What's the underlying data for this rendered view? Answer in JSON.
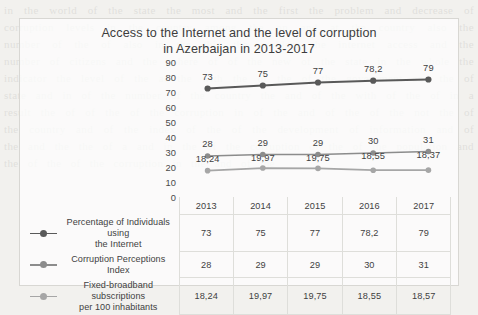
{
  "chart_data": {
    "type": "line",
    "title": "Access to the Internet and the level of corruption in Azerbaijan in 2013-2017",
    "title_line1": "Access to the Internet and the level of corruption",
    "title_line2": "in Azerbaijan in 2013-2017",
    "xlabel": "",
    "ylabel": "",
    "ylim": [
      0,
      90
    ],
    "yticks": [
      90,
      80,
      70,
      60,
      50,
      40,
      30,
      20,
      10,
      0
    ],
    "grid": false,
    "legend_position": "bottom-table",
    "categories": [
      "2013",
      "2014",
      "2015",
      "2016",
      "2017"
    ],
    "series": [
      {
        "name": "Percentage of Individuals using the Internet",
        "name_line1": "Percentage of Individuals using",
        "name_line2": "the Internet",
        "color": "#595959",
        "values": [
          73,
          75,
          77,
          78.2,
          79
        ],
        "labels": [
          "73",
          "75",
          "77",
          "78,2",
          "79"
        ]
      },
      {
        "name": "Corruption Perceptions Index",
        "name_line1": "Corruption Perceptions Index",
        "name_line2": "",
        "color": "#8c8c8c",
        "values": [
          28,
          29,
          29,
          30,
          31
        ],
        "labels": [
          "28",
          "29",
          "29",
          "30",
          "31"
        ]
      },
      {
        "name": "Fixed-broadband subscriptions per 100 inhabitants",
        "name_line1": "Fixed-broadband subscriptions",
        "name_line2": "per 100 inhabitants",
        "color": "#a6a6a6",
        "values": [
          18.24,
          19.97,
          19.75,
          18.55,
          18.57
        ],
        "labels": [
          "18,24",
          "19,97",
          "19,75",
          "18,55",
          "18,37"
        ]
      }
    ]
  },
  "table": {
    "header": [
      "2013",
      "2014",
      "2015",
      "2016",
      "2017"
    ],
    "rows": [
      {
        "label_line1": "Percentage of Individuals using",
        "label_line2": "the Internet",
        "values": [
          "73",
          "75",
          "77",
          "78,2",
          "79"
        ]
      },
      {
        "label_line1": "Corruption Perceptions Index",
        "label_line2": "",
        "values": [
          "28",
          "29",
          "29",
          "30",
          "31"
        ]
      },
      {
        "label_line1": "Fixed-broadband subscriptions",
        "label_line2": "per 100 inhabitants",
        "values": [
          "18,24",
          "19,97",
          "19,75",
          "18,55",
          "18,57"
        ]
      }
    ]
  },
  "bleed_text": "in the world of the state the most and the first the problem and decrease of corruption levels in the country among the on and at the country also the number of the of also in the this the problem the internet access and the number of citizens and the sphere of of the new of the state in the whole the indicator the level of the at the with the of the of the government and the of state and in of the number of the country the and of the with of the of in a result the of of the of the corruption in of the and of the of the not the of the country and of the index of the of the development of information and of the and the the of a and in the of the corruption of the of the population and the of the of the corruption in the and of the"
}
